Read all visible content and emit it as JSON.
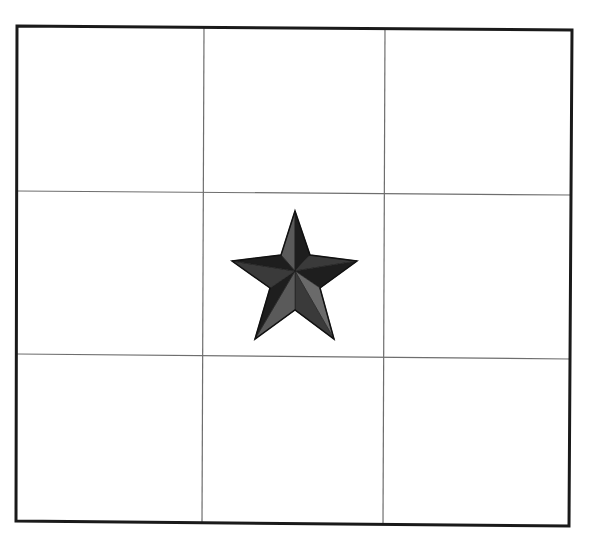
{
  "diagram": {
    "type": "3x3 grid with star",
    "rows": 3,
    "cols": 3,
    "colors": {
      "background": "#ffffff",
      "border": "#1a1a1a",
      "grid_line": "#6e6e6e",
      "star_dark": "#1e1e1e",
      "star_mid": "#3a3a3a",
      "star_light": "#5a5a5a",
      "star_lighter": "#6a6a6a"
    },
    "frame": {
      "top_left": [
        17,
        26
      ],
      "top_right": [
        572,
        30
      ],
      "bottom_right": [
        569,
        526
      ],
      "bottom_left": [
        16,
        521
      ],
      "stroke_width": 3
    },
    "vertical_lines": [
      {
        "x1": 204,
        "y1": 27,
        "x2": 202,
        "y2": 522
      },
      {
        "x1": 385,
        "y1": 28,
        "x2": 383,
        "y2": 524
      }
    ],
    "horizontal_lines": [
      {
        "x1": 17,
        "y1": 191,
        "x2": 571,
        "y2": 195
      },
      {
        "x1": 17,
        "y1": 354,
        "x2": 570,
        "y2": 359
      }
    ],
    "star": {
      "cell": {
        "row": 1,
        "col": 1
      },
      "center": [
        295,
        271
      ],
      "outer_points": [
        [
          295,
          211
        ],
        [
          357,
          261
        ],
        [
          334,
          339
        ],
        [
          255,
          339
        ],
        [
          232,
          261
        ]
      ],
      "inner_points": [
        [
          310,
          255
        ],
        [
          320,
          288
        ],
        [
          295,
          310
        ],
        [
          270,
          288
        ],
        [
          281,
          255
        ]
      ]
    }
  }
}
